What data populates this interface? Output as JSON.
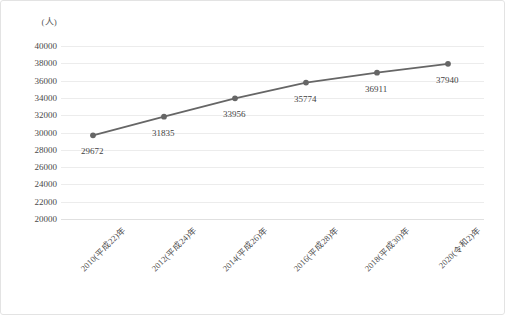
{
  "chart_data": {
    "type": "line",
    "title": "",
    "xlabel": "",
    "ylabel": "(人)",
    "unit_label": "(人)",
    "categories": [
      "2010(平成22)年",
      "2012(平成24)年",
      "2014(平成26)年",
      "2016(平成28)年",
      "2018(平成30)年",
      "2020(令和2)年"
    ],
    "values": [
      29672,
      31835,
      33956,
      35774,
      36911,
      37940
    ],
    "point_labels": [
      "29672",
      "31835",
      "33956",
      "35774",
      "36911",
      "37940"
    ],
    "ylim": [
      20000,
      40000
    ],
    "yticks": [
      40000,
      38000,
      36000,
      34000,
      32000,
      30000,
      28000,
      26000,
      24000,
      22000,
      20000
    ],
    "ytick_labels": [
      "40000",
      "38000",
      "36000",
      "34000",
      "32000",
      "30000",
      "28000",
      "26000",
      "24000",
      "22000",
      "20000"
    ],
    "grid": true,
    "legend": "none",
    "series_color": "#666666",
    "marker_color": "#666666",
    "gridline_color": "#ececec",
    "border_color": "#e3e3e3"
  }
}
